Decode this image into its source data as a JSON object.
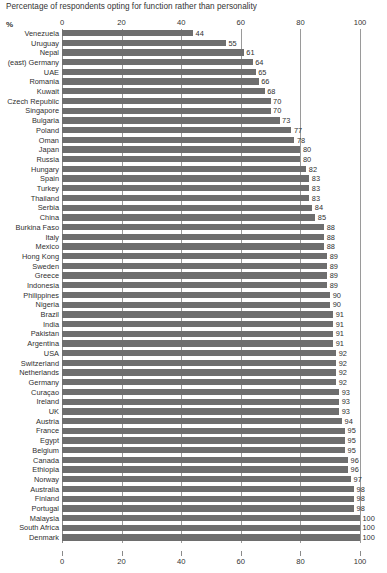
{
  "chart_data": {
    "type": "bar",
    "orientation": "horizontal",
    "title": "Percentage of respondents opting for function rather than personality",
    "xlabel": "%",
    "ylabel": "",
    "xlim": [
      0,
      100
    ],
    "grid": true,
    "legend": false,
    "axis_ticks": [
      0,
      20,
      40,
      60,
      80,
      100
    ],
    "axis_tick_labels": [
      "0",
      "20",
      "40",
      "60",
      "80",
      "100"
    ],
    "axis_positions": [
      "top",
      "bottom"
    ],
    "bar_color": "#6e6e6e",
    "categories": [
      "Venezuela",
      "Uruguay",
      "Nepal",
      "(east) Germany",
      "UAE",
      "Romania",
      "Kuwait",
      "Czech Republic",
      "Singapore",
      "Bulgaria",
      "Poland",
      "Oman",
      "Japan",
      "Russia",
      "Hungary",
      "Spain",
      "Turkey",
      "Thailand",
      "Serbia",
      "China",
      "Burkina Faso",
      "Italy",
      "Mexico",
      "Hong Kong",
      "Sweden",
      "Greece",
      "Indonesia",
      "Philippines",
      "Nigeria",
      "Brazil",
      "India",
      "Pakistan",
      "Argentina",
      "USA",
      "Switzerland",
      "Netherlands",
      "Germany",
      "Curaçao",
      "Ireland",
      "UK",
      "Austria",
      "France",
      "Egypt",
      "Belgium",
      "Canada",
      "Ethiopia",
      "Norway",
      "Australia",
      "Finland",
      "Portugal",
      "Malaysia",
      "South Africa",
      "Denmark"
    ],
    "values": [
      44,
      55,
      61,
      64,
      65,
      66,
      68,
      70,
      70,
      73,
      77,
      78,
      80,
      80,
      82,
      83,
      83,
      83,
      84,
      85,
      88,
      88,
      88,
      89,
      89,
      89,
      89,
      90,
      90,
      91,
      91,
      91,
      91,
      92,
      92,
      92,
      92,
      93,
      93,
      93,
      94,
      95,
      95,
      95,
      96,
      96,
      97,
      98,
      98,
      98,
      100,
      100,
      100
    ],
    "value_labels": [
      "44",
      "55",
      "61",
      "64",
      "65",
      "66",
      "68",
      "70",
      "70",
      "73",
      "77",
      "78",
      "80",
      "80",
      "82",
      "83",
      "83",
      "83",
      "84",
      "85",
      "88",
      "88",
      "88",
      "89",
      "89",
      "89",
      "89",
      "90",
      "90",
      "91",
      "91",
      "91",
      "91",
      "92",
      "92",
      "92",
      "92",
      "93",
      "93",
      "93",
      "94",
      "95",
      "95",
      "95",
      "96",
      "96",
      "97",
      "98",
      "98",
      "98",
      "100",
      "100",
      "100"
    ]
  }
}
